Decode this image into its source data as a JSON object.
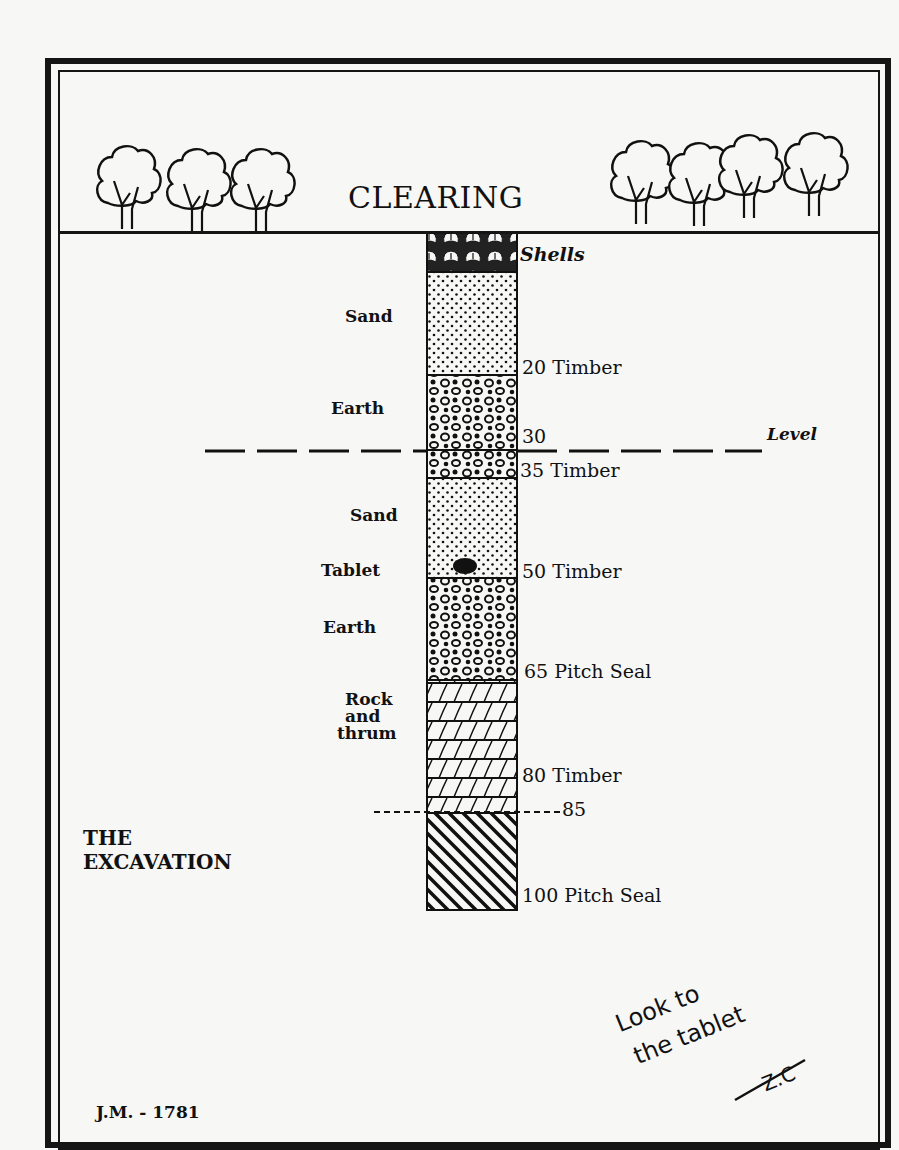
{
  "diagram": {
    "title": "CLEARING",
    "caption_line1": "THE",
    "caption_line2": "EXCAVATION",
    "signature": "J.M. - 1781",
    "note_line1": "Look to",
    "note_line2": "the tablet",
    "note_initials": "Z.C",
    "level_label": "Level",
    "left_labels": {
      "sand1": "Sand",
      "earth1": "Earth",
      "sand2": "Sand",
      "tablet": "Tablet",
      "earth2": "Earth",
      "rock1": "Rock",
      "rock2": "and",
      "rock3": "thrum"
    },
    "right_labels": {
      "shells": "Shells",
      "d20": "20 Timber",
      "d30": "30",
      "d35": "35 Timber",
      "d50": "50 Timber",
      "d65": "65 Pitch Seal",
      "d80": "80 Timber",
      "d85": "85",
      "d100": "100 Pitch Seal"
    },
    "layers": [
      {
        "name": "Shells",
        "pattern": "shells",
        "top_depth": 0,
        "bottom_depth": 5
      },
      {
        "name": "Sand",
        "pattern": "dots",
        "top_depth": 5,
        "bottom_depth": 20
      },
      {
        "name": "Earth",
        "pattern": "pebbles",
        "top_depth": 20,
        "bottom_depth": 35
      },
      {
        "name": "Sand",
        "pattern": "dots",
        "top_depth": 35,
        "bottom_depth": 50
      },
      {
        "name": "Earth",
        "pattern": "pebbles",
        "top_depth": 50,
        "bottom_depth": 65
      },
      {
        "name": "Rock and thrum",
        "pattern": "bricks",
        "top_depth": 65,
        "bottom_depth": 80
      },
      {
        "name": "Hatched",
        "pattern": "diagonal",
        "top_depth": 80,
        "bottom_depth": 100
      }
    ],
    "colors": {
      "ink": "#111111",
      "paper": "#f7f7f5"
    }
  }
}
